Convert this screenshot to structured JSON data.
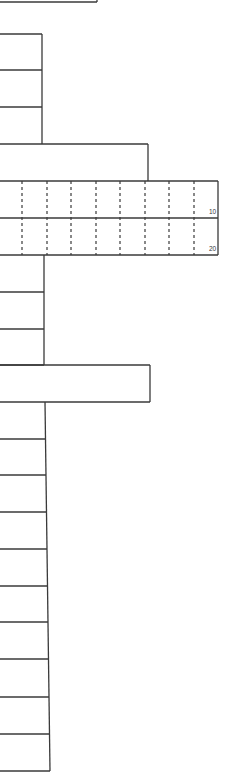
{
  "figure": {
    "type": "line-drawing",
    "line_color": "#3a3a3a",
    "background": "#ffffff"
  },
  "top_segment": {
    "y": 2,
    "x_end": 97
  },
  "upper_stack": {
    "spine_x": 42,
    "rungs_y": [
      34,
      70,
      107,
      144
    ]
  },
  "upper_wide_step": {
    "y_top": 144,
    "x_right": 148,
    "y_bottom": 181
  },
  "grid_panel": {
    "x_left": 0,
    "x_right": 218,
    "rows_y": [
      181,
      218,
      255
    ],
    "dashed_columns_x": [
      22,
      47,
      71,
      96,
      120,
      145,
      169,
      194
    ],
    "labels": [
      {
        "text": "10",
        "x": 209,
        "y": 214
      },
      {
        "text": "20",
        "x": 209,
        "y": 251
      }
    ]
  },
  "middle_stack": {
    "spine_x": 44,
    "rungs_y": [
      255,
      292,
      329,
      365
    ]
  },
  "lower_wide_box": {
    "y_top": 365,
    "y_bottom": 402,
    "x_right": 150
  },
  "lower_stack": {
    "spine_x_top": 45,
    "spine_x_bottom": 50,
    "rungs_y": [
      402,
      439,
      475,
      512,
      549,
      586,
      622,
      659,
      697,
      734,
      771
    ]
  }
}
